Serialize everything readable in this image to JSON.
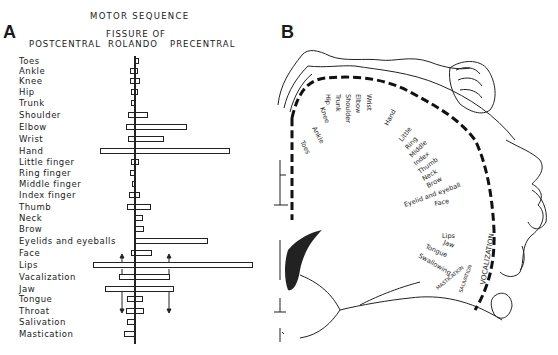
{
  "panel_a": {
    "letter": "A",
    "title": "MOTOR SEQUENCE",
    "header_left": "POSTCENTRAL",
    "header_center_line1": "FISSURE OF",
    "header_center_line2": "ROLANDO",
    "header_right": "PRECENTRAL"
  },
  "panel_b": {
    "letter": "B",
    "labels": {
      "toes": "Toes",
      "ankle": "Ankle",
      "knee": "Knee",
      "hip": "Hip",
      "trunk": "Trunk",
      "shoulder": "Shoulder",
      "elbow": "Elbow",
      "wrist": "Wrist",
      "hand": "Hand",
      "little": "Little",
      "ring": "Ring",
      "middle": "Middle",
      "index": "Index",
      "thumb": "Thumb",
      "neck": "Neck",
      "brow": "Brow",
      "eyelid": "Eyelid and eyeball",
      "face": "Face",
      "lips": "Lips",
      "jaw": "Jaw",
      "tongue": "Tongue",
      "swallowing": "Swallowing",
      "vocalization": "VOCALIZATION",
      "salivation": "SALIVATION",
      "mastication": "MASTICATION"
    }
  },
  "chart_data": {
    "type": "bar",
    "title": "MOTOR SEQUENCE",
    "subtitle": "FISSURE OF ROLANDO",
    "xlabel_left": "POSTCENTRAL",
    "xlabel_right": "PRECENTRAL",
    "note": "Horizontal bars extend left (postcentral) and right (precentral) from the fissure of Rolando; values are relative extents in px from the central line.",
    "categories": [
      "Toes",
      "Ankle",
      "Knee",
      "Hip",
      "Trunk",
      "Shoulder",
      "Elbow",
      "Wrist",
      "Hand",
      "Little finger",
      "Ring finger",
      "Middle finger",
      "Index finger",
      "Thumb",
      "Neck",
      "Brow",
      "Eyelids and eyeballs",
      "Face",
      "Lips",
      "Vacalization",
      "Jaw",
      "Tongue",
      "Throat",
      "Salivation",
      "Mastication"
    ],
    "series": [
      {
        "name": "postcentral_extent",
        "values": [
          0,
          4,
          4,
          3,
          3,
          6,
          8,
          6,
          34,
          3,
          4,
          2,
          5,
          7,
          0,
          0,
          0,
          3,
          41,
          15,
          29,
          7,
          8,
          7,
          10
        ]
      },
      {
        "name": "precentral_extent",
        "values": [
          5,
          4,
          6,
          4,
          2,
          14,
          53,
          30,
          96,
          5,
          2,
          1,
          6,
          17,
          9,
          10,
          74,
          18,
          119,
          36,
          40,
          9,
          10,
          1,
          2
        ]
      }
    ],
    "row_y": [
      61,
      71,
      81,
      92,
      103,
      115,
      127,
      139,
      151,
      162,
      173,
      184,
      195,
      207,
      218,
      229,
      241,
      253,
      265,
      277,
      289,
      299,
      311,
      322,
      334
    ],
    "center_x": 134,
    "annotations": [
      "arrows above Lips at postcentral and precentral",
      "arrows below Jaw extending to Throat"
    ]
  }
}
